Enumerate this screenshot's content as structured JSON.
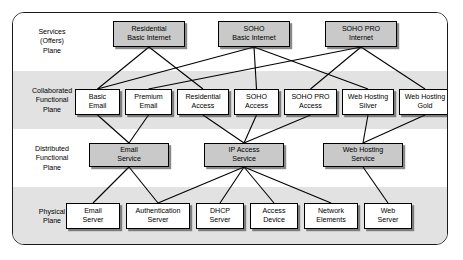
{
  "diagram": {
    "planes": [
      {
        "id": "services",
        "label": "Services\n(Offers)\nPlane",
        "label_lines": [
          "Services",
          "(Offers)",
          "Plane"
        ],
        "band": "white"
      },
      {
        "id": "collaborated",
        "label": "Collaborated Functional Plane",
        "label_lines": [
          "Collaborated",
          "Functional",
          "Plane"
        ],
        "band": "gray"
      },
      {
        "id": "distributed",
        "label": "Distributed Functional Plane",
        "label_lines": [
          "Distributed",
          "Functional",
          "Plane"
        ],
        "band": "white"
      },
      {
        "id": "physical",
        "label": "Physical Plane",
        "label_lines": [
          "Physical",
          "Plane"
        ],
        "band": "gray"
      }
    ],
    "nodes": {
      "services": [
        {
          "id": "res-basic-internet",
          "lines": [
            "Residential",
            "Basic Internet"
          ],
          "fill": "gray"
        },
        {
          "id": "soho-basic-internet",
          "lines": [
            "SOHO",
            "Basic Internet"
          ],
          "fill": "gray"
        },
        {
          "id": "soho-pro-internet",
          "lines": [
            "SOHO PRO",
            "Internet"
          ],
          "fill": "gray"
        }
      ],
      "collaborated": [
        {
          "id": "basic-email",
          "lines": [
            "Basic",
            "Email"
          ],
          "fill": "white"
        },
        {
          "id": "premium-email",
          "lines": [
            "Premium",
            "Email"
          ],
          "fill": "white"
        },
        {
          "id": "residential-access",
          "lines": [
            "Residential",
            "Access"
          ],
          "fill": "white"
        },
        {
          "id": "soho-access",
          "lines": [
            "SOHO",
            "Access"
          ],
          "fill": "white"
        },
        {
          "id": "soho-pro-access",
          "lines": [
            "SOHO PRO",
            "Access"
          ],
          "fill": "white"
        },
        {
          "id": "web-hosting-silver",
          "lines": [
            "Web Hosting",
            "Silver"
          ],
          "fill": "white"
        },
        {
          "id": "web-hosting-gold",
          "lines": [
            "Web Hosting",
            "Gold"
          ],
          "fill": "white"
        }
      ],
      "distributed": [
        {
          "id": "email-service",
          "lines": [
            "Email",
            "Service"
          ],
          "fill": "gray"
        },
        {
          "id": "ip-access-service",
          "lines": [
            "IP Access",
            "Service"
          ],
          "fill": "gray"
        },
        {
          "id": "web-hosting-service",
          "lines": [
            "Web Hosting",
            "Service"
          ],
          "fill": "gray"
        }
      ],
      "physical": [
        {
          "id": "email-server",
          "lines": [
            "Email",
            "Server"
          ],
          "fill": "white"
        },
        {
          "id": "authentication-server",
          "lines": [
            "Authentication",
            "Server"
          ],
          "fill": "white"
        },
        {
          "id": "dhcp-server",
          "lines": [
            "DHCP",
            "Server"
          ],
          "fill": "white"
        },
        {
          "id": "access-device",
          "lines": [
            "Access",
            "Device"
          ],
          "fill": "white"
        },
        {
          "id": "network-elements",
          "lines": [
            "Network",
            "Elements"
          ],
          "fill": "white"
        },
        {
          "id": "web-server",
          "lines": [
            "Web",
            "Server"
          ],
          "fill": "white"
        }
      ]
    },
    "edges": [
      {
        "from": "res-basic-internet",
        "to": "basic-email"
      },
      {
        "from": "res-basic-internet",
        "to": "residential-access"
      },
      {
        "from": "soho-basic-internet",
        "to": "basic-email"
      },
      {
        "from": "soho-basic-internet",
        "to": "soho-access"
      },
      {
        "from": "soho-basic-internet",
        "to": "web-hosting-silver"
      },
      {
        "from": "soho-pro-internet",
        "to": "premium-email"
      },
      {
        "from": "soho-pro-internet",
        "to": "soho-pro-access"
      },
      {
        "from": "soho-pro-internet",
        "to": "web-hosting-gold"
      },
      {
        "from": "basic-email",
        "to": "email-service"
      },
      {
        "from": "premium-email",
        "to": "email-service"
      },
      {
        "from": "residential-access",
        "to": "ip-access-service"
      },
      {
        "from": "soho-access",
        "to": "ip-access-service"
      },
      {
        "from": "soho-pro-access",
        "to": "ip-access-service"
      },
      {
        "from": "web-hosting-silver",
        "to": "web-hosting-service"
      },
      {
        "from": "web-hosting-gold",
        "to": "web-hosting-service"
      },
      {
        "from": "email-service",
        "to": "email-server"
      },
      {
        "from": "email-service",
        "to": "authentication-server"
      },
      {
        "from": "ip-access-service",
        "to": "authentication-server"
      },
      {
        "from": "ip-access-service",
        "to": "dhcp-server"
      },
      {
        "from": "ip-access-service",
        "to": "access-device"
      },
      {
        "from": "ip-access-service",
        "to": "network-elements"
      },
      {
        "from": "web-hosting-service",
        "to": "web-server"
      }
    ],
    "colors": {
      "frame_border": "#1a1a1a",
      "band_gray": "#e2e2e2",
      "band_white": "#ffffff",
      "node_gray": "#c9c9c9",
      "node_white": "#ffffff",
      "line": "#000000"
    }
  },
  "layout": {
    "bands": [
      {
        "id": "services",
        "top": 0,
        "height": 58
      },
      {
        "id": "collaborated",
        "height": 58,
        "top": 58
      },
      {
        "id": "distributed",
        "height": 58,
        "top": 116
      },
      {
        "id": "physical",
        "height": 59,
        "top": 174
      }
    ],
    "label_positions": [
      {
        "id": "services",
        "x": 2,
        "y": 15
      },
      {
        "id": "collaborated",
        "x": 2,
        "y": 74
      },
      {
        "id": "distributed",
        "x": 2,
        "y": 132
      },
      {
        "id": "physical",
        "x": 2,
        "y": 195
      }
    ],
    "node_boxes": {
      "res-basic-internet": {
        "x": 100,
        "y": 8,
        "w": 72,
        "h": 26
      },
      "soho-basic-internet": {
        "x": 205,
        "y": 8,
        "w": 72,
        "h": 26
      },
      "soho-pro-internet": {
        "x": 312,
        "y": 8,
        "w": 72,
        "h": 26
      },
      "basic-email": {
        "x": 62,
        "y": 76,
        "w": 45,
        "h": 26
      },
      "premium-email": {
        "x": 112,
        "y": 76,
        "w": 47,
        "h": 26
      },
      "residential-access": {
        "x": 164,
        "y": 76,
        "w": 52,
        "h": 26
      },
      "soho-access": {
        "x": 221,
        "y": 76,
        "w": 45,
        "h": 26
      },
      "soho-pro-access": {
        "x": 271,
        "y": 76,
        "w": 53,
        "h": 26
      },
      "web-hosting-silver": {
        "x": 329,
        "y": 76,
        "w": 52,
        "h": 26
      },
      "web-hosting-gold": {
        "x": 386,
        "y": 76,
        "w": 52,
        "h": 26
      },
      "email-service": {
        "x": 76,
        "y": 130,
        "w": 80,
        "h": 24
      },
      "ip-access-service": {
        "x": 191,
        "y": 130,
        "w": 80,
        "h": 24
      },
      "web-hosting-service": {
        "x": 310,
        "y": 130,
        "w": 80,
        "h": 24
      },
      "email-server": {
        "x": 53,
        "y": 190,
        "w": 54,
        "h": 26
      },
      "authentication-server": {
        "x": 113,
        "y": 190,
        "w": 64,
        "h": 26
      },
      "dhcp-server": {
        "x": 183,
        "y": 190,
        "w": 48,
        "h": 26
      },
      "access-device": {
        "x": 237,
        "y": 190,
        "w": 48,
        "h": 26
      },
      "network-elements": {
        "x": 291,
        "y": 190,
        "w": 54,
        "h": 26
      },
      "web-server": {
        "x": 351,
        "y": 190,
        "w": 48,
        "h": 26
      }
    }
  }
}
